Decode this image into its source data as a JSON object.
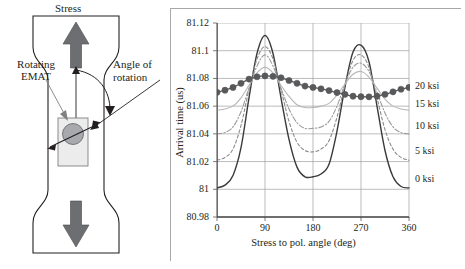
{
  "figure": {
    "schematic": {
      "labels": {
        "stress": "Stress",
        "rotating_emat": "Rotating\nEMAT",
        "angle_of_rotation": "Angle of\nrotation"
      },
      "icons": {
        "up_arrow": "stress-up-arrow",
        "down_arrow": "stress-down-arrow",
        "emat_probe": "emat-probe",
        "rotation_arc": "rotation-arc-arrow",
        "polarization_arrow": "polarization-double-arrow"
      },
      "colors": {
        "specimen_outline": "#231f20",
        "arrow_fill": "#6d6e71",
        "probe_fill": "#e6e6e6",
        "coil_fill": "#a7a9ac"
      }
    }
  },
  "chart_data": {
    "type": "line",
    "title": "",
    "xlabel": "Stress to pol. angle (deg)",
    "ylabel": "Arrival time (us)",
    "xlim": [
      0,
      360
    ],
    "ylim": [
      80.98,
      81.12
    ],
    "xticks": [
      "0",
      "90",
      "180",
      "270",
      "360"
    ],
    "xtick_values": [
      0,
      90,
      180,
      270,
      360
    ],
    "yticks": [
      "80.98",
      "81",
      "81.02",
      "81.04",
      "81.06",
      "81.08",
      "81.1",
      "81.12"
    ],
    "ytick_values": [
      80.98,
      81.0,
      81.02,
      81.04,
      81.06,
      81.08,
      81.1,
      81.12
    ],
    "grid": true,
    "legend_position": "right",
    "right_labels": [
      "20 ksi",
      "15 ksi",
      "10 ksi",
      "5 ksi",
      "0 ksi"
    ],
    "right_label_values": [
      81.0745,
      81.0615,
      81.0455,
      81.0275,
      81.0075
    ],
    "x": [
      0,
      15,
      30,
      45,
      60,
      75,
      90,
      105,
      120,
      135,
      150,
      165,
      180,
      195,
      210,
      225,
      240,
      255,
      270,
      285,
      300,
      315,
      330,
      345,
      360
    ],
    "series": [
      {
        "name": "0 ksi",
        "color": "#3a3a3a",
        "style": "solid",
        "width": 1.4,
        "markers": false,
        "values": [
          81.001,
          81.003,
          81.01,
          81.03,
          81.066,
          81.098,
          81.111,
          81.098,
          81.066,
          81.036,
          81.016,
          81.009,
          81.009,
          81.011,
          81.018,
          81.042,
          81.074,
          81.099,
          81.104,
          81.092,
          81.06,
          81.028,
          81.009,
          81.002,
          81.001
        ]
      },
      {
        "name": "5 ksi",
        "color": "#8a8a8a",
        "style": "dashed",
        "width": 1.1,
        "markers": false,
        "values": [
          81.021,
          81.023,
          81.029,
          81.046,
          81.072,
          81.094,
          81.103,
          81.094,
          81.072,
          81.049,
          81.034,
          81.028,
          81.027,
          81.029,
          81.035,
          81.052,
          81.075,
          81.093,
          81.097,
          81.088,
          81.066,
          81.043,
          81.029,
          81.023,
          81.021
        ]
      },
      {
        "name": "10 ksi",
        "color": "#9a9a9a",
        "style": "dashdot",
        "width": 1.1,
        "markers": false,
        "values": [
          81.04,
          81.041,
          81.045,
          81.056,
          81.073,
          81.089,
          81.097,
          81.089,
          81.073,
          81.058,
          81.048,
          81.044,
          81.044,
          81.045,
          81.049,
          81.06,
          81.076,
          81.088,
          81.091,
          81.085,
          81.07,
          81.055,
          81.045,
          81.041,
          81.04
        ]
      },
      {
        "name": "15 ksi",
        "color": "#b7b7b7",
        "style": "solid",
        "width": 1.1,
        "markers": false,
        "values": [
          81.057,
          81.058,
          81.06,
          81.066,
          81.075,
          81.084,
          81.088,
          81.084,
          81.075,
          81.067,
          81.061,
          81.059,
          81.059,
          81.06,
          81.062,
          81.068,
          81.076,
          81.083,
          81.085,
          81.081,
          81.073,
          81.065,
          81.06,
          81.058,
          81.057
        ]
      },
      {
        "name": "20 ksi",
        "color": "#58595b",
        "style": "solid",
        "width": 1.3,
        "markers": true,
        "marker_shape": "circle",
        "marker_size": 3.1,
        "values": [
          81.07,
          81.0715,
          81.0735,
          81.0765,
          81.0795,
          81.0812,
          81.0818,
          81.0815,
          81.0805,
          81.0785,
          81.0765,
          81.0745,
          81.0735,
          81.0725,
          81.0712,
          81.0698,
          81.0685,
          81.0672,
          81.0668,
          81.0667,
          81.0672,
          81.0685,
          81.0703,
          81.0722,
          81.0735
        ]
      }
    ]
  }
}
